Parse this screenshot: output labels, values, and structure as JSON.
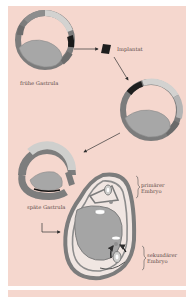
{
  "figure": {
    "labels": {
      "early_gastrula": "frühe Gastrula",
      "implant": "Implantat",
      "late_gastrula": "späte Gastrula",
      "primary_embryo_line1": "primärer",
      "primary_embryo_line2": "Embryo",
      "secondary_embryo_line1": "sekundärer",
      "secondary_embryo_line2": "Embryo"
    },
    "colors": {
      "background": "#f5d7ce",
      "tissue_dark": "#7a7a7a",
      "tissue_mid": "#9a9a9a",
      "tissue_light": "#d0cfcd",
      "yolk": "#a8a8a8",
      "implant": "#1e1e1e",
      "arrow": "#3a3a3a"
    }
  }
}
